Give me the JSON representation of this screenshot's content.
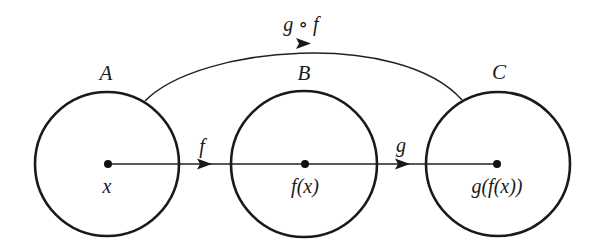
{
  "diagram": {
    "type": "function-composition",
    "sets": [
      {
        "id": "A",
        "label": "A",
        "point_label": "x",
        "cx": 107,
        "cy": 164,
        "r": 72
      },
      {
        "id": "B",
        "label": "B",
        "point_label": "f(x)",
        "cx": 304,
        "cy": 164,
        "r": 73
      },
      {
        "id": "C",
        "label": "C",
        "point_label": "g(f(x))",
        "cx": 498,
        "cy": 164,
        "r": 72
      }
    ],
    "arrows": [
      {
        "id": "f",
        "label": "f",
        "from": "A",
        "to": "B"
      },
      {
        "id": "g",
        "label": "g",
        "from": "B",
        "to": "C"
      },
      {
        "id": "g_of_f",
        "label": "g ∘ f",
        "from": "A",
        "to": "C",
        "style": "curved-above"
      }
    ],
    "colors": {
      "stroke": "#1a1a1a",
      "background": "#ffffff"
    }
  }
}
